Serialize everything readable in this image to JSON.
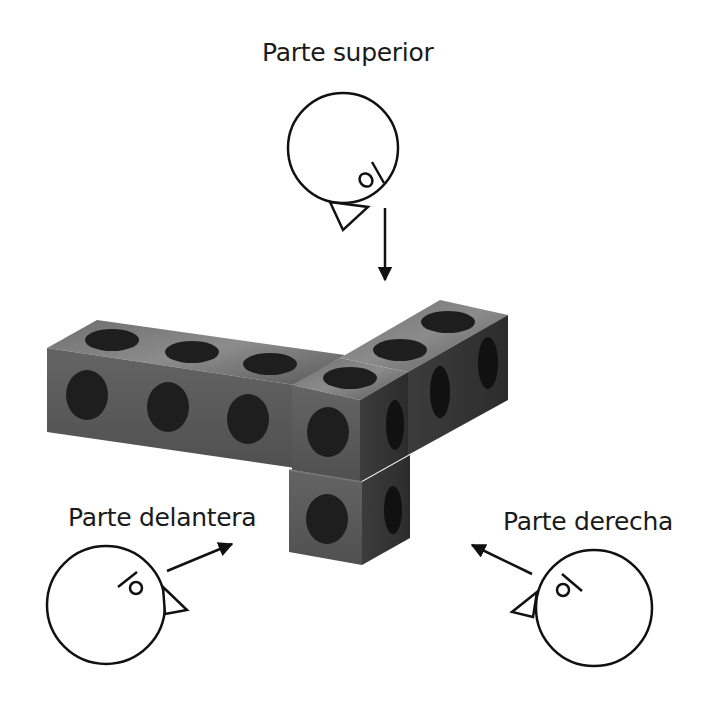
{
  "labels": {
    "top": "Parte superior",
    "front": "Parte delantera",
    "right": "Parte derecha"
  },
  "colors": {
    "background": "#ffffff",
    "outline": "#1a1a1a",
    "cube_front": "#5a5a5a",
    "cube_top": "#7a7a7a",
    "cube_side": "#3a3a3a",
    "hole": "#1e1e1e"
  },
  "figure": {
    "cube_count": 7
  }
}
